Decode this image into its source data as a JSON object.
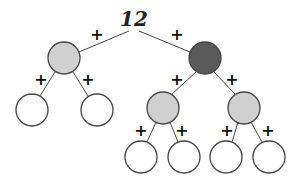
{
  "diagram": {
    "root_label": "12",
    "edge_label": "+",
    "colors": {
      "light": "#d0d0d0",
      "dark": "#5a5a5a",
      "empty": "#ffffff",
      "stroke": "#444444"
    },
    "nodes": [
      {
        "id": "n1",
        "fill": "light",
        "x": 64,
        "y": 58
      },
      {
        "id": "n2",
        "fill": "dark",
        "x": 205,
        "y": 58
      },
      {
        "id": "n3",
        "fill": "empty",
        "x": 32,
        "y": 110
      },
      {
        "id": "n4",
        "fill": "empty",
        "x": 97,
        "y": 110
      },
      {
        "id": "n5",
        "fill": "light",
        "x": 163,
        "y": 108
      },
      {
        "id": "n6",
        "fill": "light",
        "x": 244,
        "y": 108
      },
      {
        "id": "n7",
        "fill": "empty",
        "x": 141,
        "y": 157
      },
      {
        "id": "n8",
        "fill": "empty",
        "x": 184,
        "y": 157
      },
      {
        "id": "n9",
        "fill": "empty",
        "x": 226,
        "y": 157
      },
      {
        "id": "n10",
        "fill": "empty",
        "x": 269,
        "y": 157
      }
    ]
  }
}
